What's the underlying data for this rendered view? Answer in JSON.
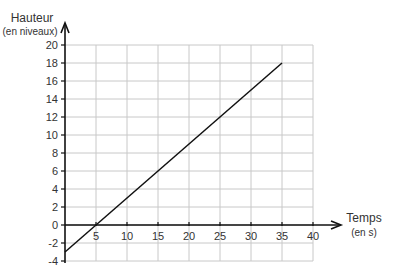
{
  "chart_data": {
    "type": "line",
    "title": "",
    "ylabel": "Hauteur",
    "ylabel_unit": "(en niveaux)",
    "xlabel": "Temps",
    "xlabel_unit": "(en s)",
    "xlim": [
      0,
      40
    ],
    "ylim": [
      -4,
      20
    ],
    "x_ticks": [
      5,
      10,
      15,
      20,
      25,
      30,
      35,
      40
    ],
    "y_ticks": [
      -4,
      -2,
      0,
      2,
      4,
      6,
      8,
      10,
      12,
      14,
      16,
      18,
      20
    ],
    "grid": true,
    "series": [
      {
        "name": "Hauteur",
        "x": [
          0,
          5,
          35
        ],
        "values": [
          -3,
          0,
          18
        ]
      }
    ]
  }
}
